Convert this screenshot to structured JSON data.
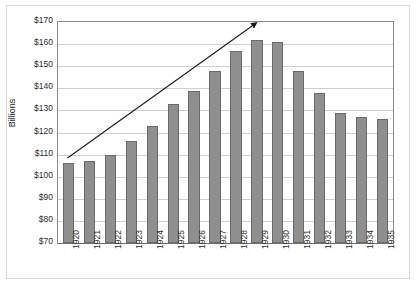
{
  "chart_data": {
    "type": "bar",
    "title": "",
    "subtitle": "",
    "xlabel": "",
    "ylabel": "Billions",
    "categories": [
      "1920",
      "1921",
      "1922",
      "1923",
      "1924",
      "1925",
      "1926",
      "1927",
      "1928",
      "1929",
      "1930",
      "1931",
      "1932",
      "1933",
      "1934",
      "1935"
    ],
    "values": [
      106,
      107,
      110,
      116,
      123,
      133,
      139,
      148,
      157,
      162,
      161,
      148,
      138,
      129,
      127,
      126
    ],
    "series": [
      {
        "name": "Billions",
        "values": [
          106,
          107,
          110,
          116,
          123,
          133,
          139,
          148,
          157,
          162,
          161,
          148,
          138,
          129,
          127,
          126
        ]
      }
    ],
    "ylim": [
      70,
      170
    ],
    "ytick_labels": [
      "$170",
      "$160",
      "$150",
      "$140",
      "$130",
      "$120",
      "$110",
      "$100",
      "$90",
      "$80",
      "$70"
    ],
    "ytick_values": [
      170,
      160,
      150,
      140,
      130,
      120,
      110,
      100,
      90,
      80,
      70
    ],
    "ytick_step": 10,
    "grid": true,
    "grid_axis": "y",
    "legend": false,
    "legend_position": "none",
    "bar_color": "#8f8f8f",
    "bar_border_color": "#6a6a6a",
    "gridline_color": "#cfcfcf",
    "axis_color": "#8a8a8a",
    "annotations": [
      {
        "name": "trend-arrow",
        "type": "arrow",
        "description": "upward trend arrow",
        "from_year": "1920",
        "from_value": 108,
        "to_year": "1929",
        "to_value": 169,
        "color": "#1a1a1a"
      }
    ]
  }
}
